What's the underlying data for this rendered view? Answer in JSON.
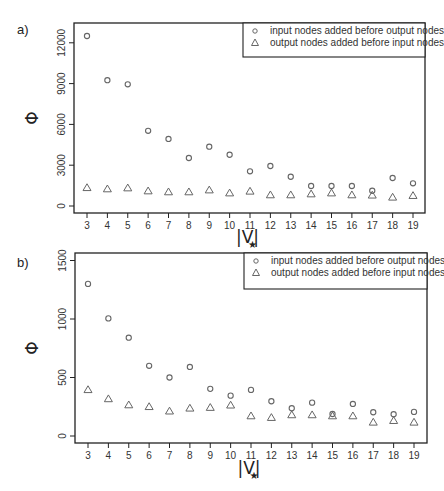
{
  "figure": {
    "top_caption_fragment": "",
    "panels": [
      "a)",
      "b)"
    ]
  },
  "chart_data": [
    {
      "type": "scatter",
      "panel_label": "a)",
      "title": "",
      "xlabel": "|V*|",
      "ylabel": "Φ",
      "x": [
        3,
        4,
        5,
        6,
        7,
        8,
        9,
        10,
        11,
        12,
        13,
        14,
        15,
        16,
        17,
        18,
        19
      ],
      "xticks": [
        "3",
        "4",
        "5",
        "6",
        "7",
        "8",
        "9",
        "10",
        "11",
        "12",
        "13",
        "14",
        "15",
        "16",
        "17",
        "18",
        "19"
      ],
      "yticks": [
        "0",
        "3000",
        "6000",
        "9000",
        "12000"
      ],
      "ylim": [
        -500,
        13300
      ],
      "grid": false,
      "legend_position": "top-right",
      "series": [
        {
          "name": "input nodes added before output nodes",
          "marker": "circle",
          "values": [
            12500,
            9250,
            8950,
            5530,
            4930,
            3530,
            4360,
            3770,
            2550,
            2940,
            2150,
            1470,
            1470,
            1470,
            1120,
            2060,
            1670
          ]
        },
        {
          "name": "output nodes added before input nodes",
          "marker": "triangle",
          "values": [
            1340,
            1250,
            1320,
            1100,
            1030,
            1030,
            1170,
            950,
            1080,
            810,
            810,
            880,
            950,
            810,
            790,
            640,
            760
          ]
        }
      ]
    },
    {
      "type": "scatter",
      "panel_label": "b)",
      "title": "",
      "xlabel": "|V*|",
      "ylabel": "Φ",
      "x": [
        3,
        4,
        5,
        6,
        7,
        8,
        9,
        10,
        11,
        12,
        13,
        14,
        15,
        16,
        17,
        18,
        19
      ],
      "xticks": [
        "3",
        "4",
        "5",
        "6",
        "7",
        "8",
        "9",
        "10",
        "11",
        "12",
        "13",
        "14",
        "15",
        "16",
        "17",
        "18",
        "19"
      ],
      "yticks": [
        "0",
        "500",
        "1000",
        "1500"
      ],
      "ylim": [
        -60,
        1560
      ],
      "grid": false,
      "legend_position": "top-right",
      "series": [
        {
          "name": "input nodes added before output nodes",
          "marker": "circle",
          "values": [
            1300,
            1005,
            840,
            600,
            500,
            590,
            403,
            345,
            394,
            297,
            237,
            285,
            188,
            274,
            203,
            186,
            206
          ]
        },
        {
          "name": "output nodes added before input nodes",
          "marker": "triangle",
          "values": [
            395,
            317,
            265,
            250,
            212,
            237,
            243,
            263,
            171,
            157,
            180,
            180,
            171,
            171,
            117,
            131,
            117
          ]
        }
      ]
    }
  ],
  "colors": {
    "marker": "#666666",
    "axis": "#222222",
    "text": "#333333"
  }
}
